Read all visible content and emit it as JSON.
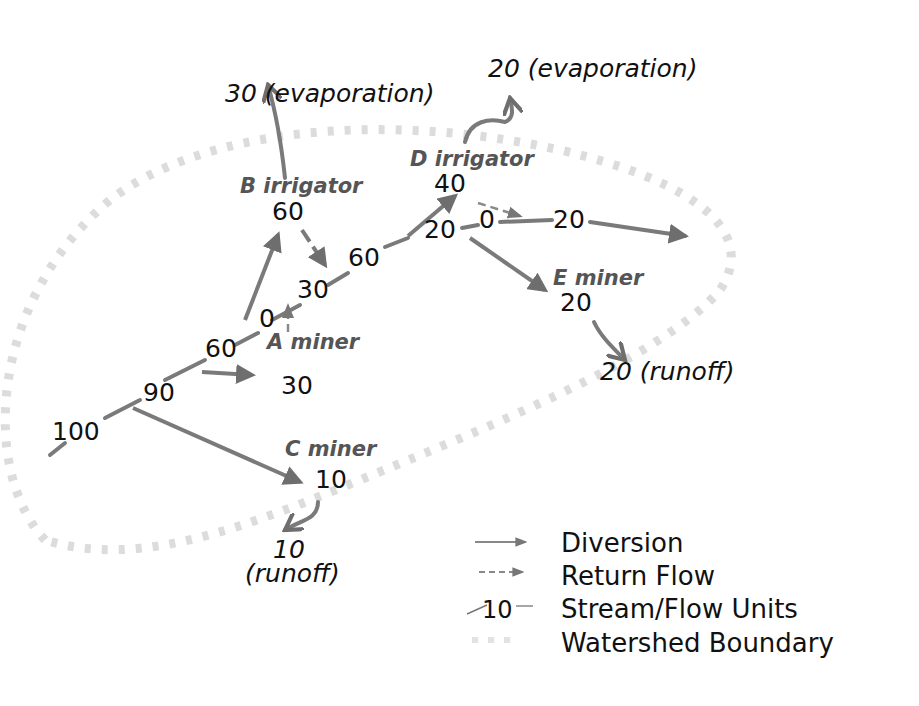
{
  "diagram": {
    "nodes": {
      "A": {
        "label": "A miner",
        "withdrawal": "30",
        "return": "0"
      },
      "B": {
        "label": "B irrigator",
        "withdrawal": "60",
        "return": "30",
        "evaporation": "30 (evaporation)"
      },
      "C": {
        "label": "C miner",
        "withdrawal": "10",
        "runoff_value": "10",
        "runoff_label": "(runoff)"
      },
      "D": {
        "label": "D irrigator",
        "withdrawal": "40",
        "return": "0",
        "evaporation": "20 (evaporation)"
      },
      "E": {
        "label": "E miner",
        "withdrawal": "20",
        "runoff": "20 (runoff)"
      }
    },
    "stream": {
      "s100": "100",
      "s90": "90",
      "s60a": "60",
      "s0": "0",
      "s30": "30",
      "s60b": "60",
      "s20a": "20",
      "s0b": "0",
      "s20b": "20"
    }
  },
  "legend": {
    "items": [
      {
        "label": "Diversion"
      },
      {
        "label": "Return Flow"
      },
      {
        "label": "Stream/Flow Units",
        "sample": "10"
      },
      {
        "label": "Watershed Boundary"
      }
    ]
  }
}
